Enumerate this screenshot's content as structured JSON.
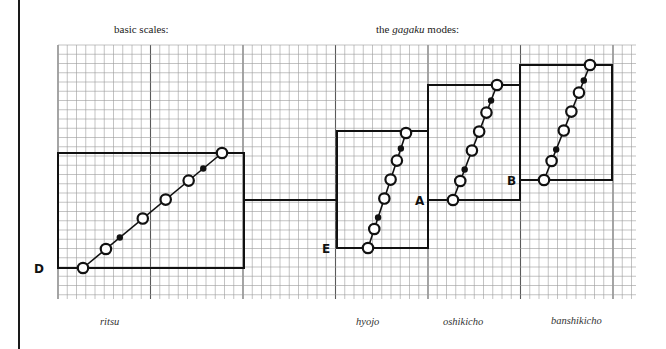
{
  "headings": {
    "basic_scales": "basic scales:",
    "gagaku_prefix": "the ",
    "gagaku_em": "gagaku",
    "gagaku_suffix": " modes:"
  },
  "grid": {
    "x0": 58,
    "x1": 636,
    "y0": 45,
    "y1": 299,
    "minor_step": 9.25,
    "major_every": 10,
    "minor_color": "#9a9a9a",
    "major_color": "#5a5a5a"
  },
  "modes": [
    {
      "id": "ritsu",
      "label": "ritsu",
      "start_note": "D",
      "box": {
        "x1": 58,
        "y1": 153,
        "x2": 244,
        "y2": 268
      },
      "line": {
        "from": [
          83,
          268
        ],
        "to": [
          222,
          153
        ]
      },
      "open_notes": [
        0,
        0.165,
        0.43,
        0.595,
        0.76,
        1.0
      ],
      "filled_notes": [
        0.265,
        0.865
      ],
      "letter_pos": [
        34,
        273
      ],
      "label_pos": [
        100,
        316
      ]
    },
    {
      "id": "hyojo",
      "label": "hyojo",
      "start_note": "E",
      "box": {
        "x1": 337,
        "y1": 131,
        "x2": 428,
        "y2": 248
      },
      "line": {
        "from": [
          368,
          248
        ],
        "to": [
          406,
          133
        ]
      },
      "open_notes": [
        0,
        0.165,
        0.43,
        0.595,
        0.76,
        1.0
      ],
      "filled_notes": [
        0.265,
        0.865
      ],
      "letter_pos": [
        322,
        253
      ],
      "label_pos": [
        356,
        316
      ]
    },
    {
      "id": "oshikicho",
      "label": "oshikicho",
      "start_note": "A",
      "box": {
        "x1": 428,
        "y1": 85,
        "x2": 520,
        "y2": 200
      },
      "line": {
        "from": [
          453,
          200
        ],
        "to": [
          497,
          85
        ]
      },
      "open_notes": [
        0,
        0.165,
        0.43,
        0.595,
        0.76,
        1.0
      ],
      "filled_notes": [
        0.265,
        0.865
      ],
      "letter_pos": [
        415,
        205
      ],
      "label_pos": [
        443,
        316
      ]
    },
    {
      "id": "banshikicho",
      "label": "banshikicho",
      "start_note": "B",
      "box": {
        "x1": 520,
        "y1": 65,
        "x2": 612,
        "y2": 180
      },
      "line": {
        "from": [
          544,
          180
        ],
        "to": [
          590,
          65
        ]
      },
      "open_notes": [
        0,
        0.165,
        0.43,
        0.595,
        0.76,
        1.0
      ],
      "filled_notes": [
        0.265,
        0.865
      ],
      "letter_pos": [
        507,
        185
      ],
      "label_pos": [
        551,
        315
      ]
    }
  ],
  "connector": {
    "x1": 244,
    "x2": 337,
    "y": 200
  },
  "colors": {
    "ink": "#111111",
    "paper": "#ffffff"
  }
}
